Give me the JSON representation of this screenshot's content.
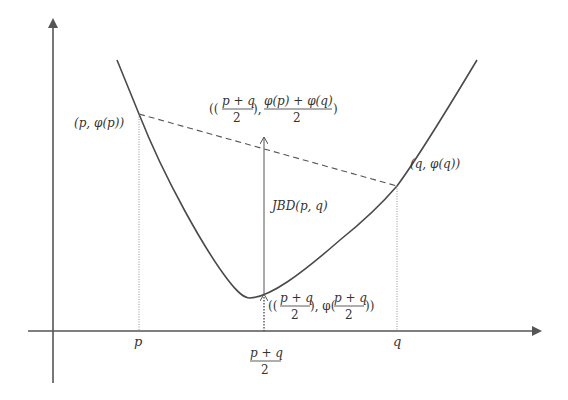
{
  "diagram": {
    "colors": {
      "axis": "#555555",
      "curve": "#4a4a4a",
      "chord": "#555555",
      "guide": "#888888",
      "text": "#333333"
    },
    "axis_labels": {
      "p": "p",
      "q": "q",
      "mid_num": "p + q",
      "mid_den": "2"
    },
    "points": {
      "p_point": "(p, φ(p))",
      "q_point": "(q, φ(q))"
    },
    "chord_mid_label": {
      "open": "((",
      "frac1_num": "p + q",
      "frac1_den": "2",
      "sep": "),",
      "frac2_num": "φ(p) + φ(q)",
      "frac2_den": "2",
      "close": ")"
    },
    "curve_mid_label": {
      "open": "((",
      "frac1_num": "p + q",
      "frac1_den": "2",
      "sep": "), φ(",
      "frac2_num": "p + q",
      "frac2_den": "2",
      "close": "))"
    },
    "gap_label": "JBD(p, q)"
  }
}
